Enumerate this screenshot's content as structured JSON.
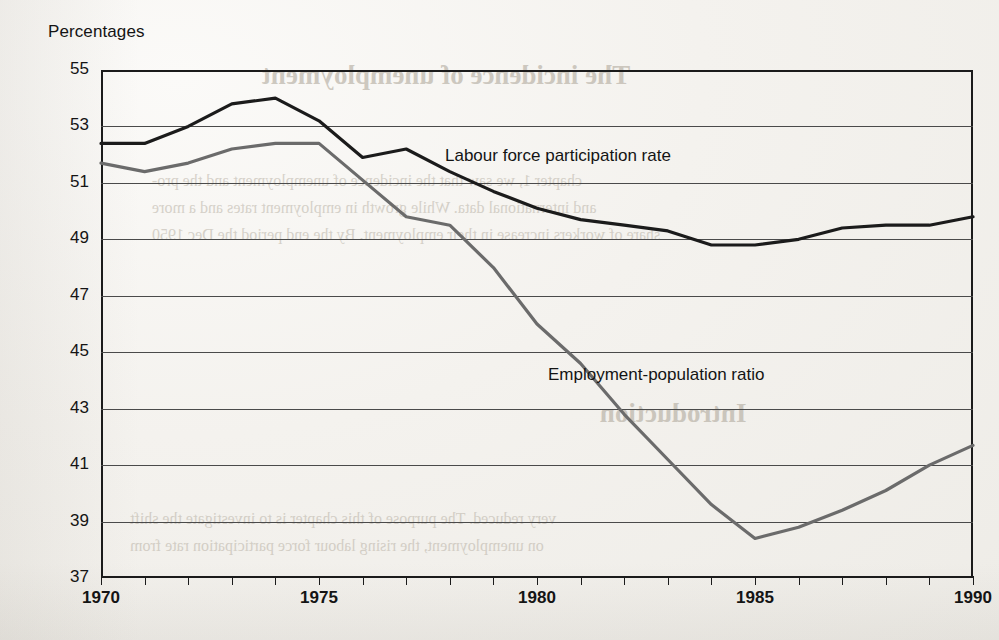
{
  "chart_data": {
    "type": "line",
    "title": "",
    "ylabel": "Percentages",
    "xlabel": "",
    "ylim": [
      37,
      55
    ],
    "xlim": [
      1970,
      1990
    ],
    "grid": true,
    "legend_position": "inline-annotation",
    "y_ticks": [
      55,
      53,
      51,
      49,
      47,
      45,
      43,
      41,
      39,
      37
    ],
    "x_ticks": [
      1970,
      1975,
      1980,
      1985,
      1990
    ],
    "x": [
      1970,
      1971,
      1972,
      1973,
      1974,
      1975,
      1976,
      1977,
      1978,
      1979,
      1980,
      1981,
      1982,
      1983,
      1984,
      1985,
      1986,
      1987,
      1988,
      1989,
      1990
    ],
    "series": [
      {
        "name": "Labour force participation rate",
        "color": "#1b1b1b",
        "values": [
          52.4,
          52.4,
          53.0,
          53.8,
          54.0,
          53.2,
          51.9,
          52.2,
          51.4,
          50.7,
          50.1,
          49.7,
          49.5,
          49.3,
          48.8,
          48.8,
          49.0,
          49.4,
          49.5,
          49.5,
          49.8
        ]
      },
      {
        "name": "Employment-population ratio",
        "color": "#6b6b6b",
        "values": [
          51.7,
          51.4,
          51.7,
          52.2,
          52.4,
          52.4,
          51.1,
          49.8,
          49.5,
          48.0,
          46.0,
          44.6,
          42.8,
          41.2,
          39.6,
          38.4,
          38.8,
          39.4,
          40.1,
          41.0,
          41.7
        ]
      }
    ],
    "annotations": [
      {
        "text": "Labour force participation rate",
        "x_px": 445,
        "y_px": 146
      },
      {
        "text": "Employment-population ratio",
        "x_px": 548,
        "y_px": 365
      }
    ]
  },
  "ghost_text": {
    "heading": "The incidence of unemployment",
    "intro_heading": "Introduction",
    "lines": [
      "chapter 1, we saw that the incidence of unemployment and the pro-",
      "and international data. While growth in employment rates and a more",
      "share of workers increase in their employment. By the end period the Dec 1950",
      "very reduced. The purpose of this chapter is to investigate the shift",
      "on unemployment, the rising labour force participation rate from"
    ]
  }
}
